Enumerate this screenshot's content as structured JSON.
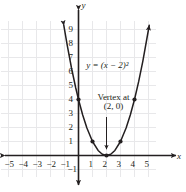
{
  "chart_data": {
    "type": "line",
    "title": "",
    "equation_label": "y = (x − 2)²",
    "annotation": {
      "line1": "Vertex at",
      "line2": "(2, 0)",
      "points_to_x": 2,
      "points_to_y": 0
    },
    "xlabel": "x",
    "ylabel": "y",
    "xlim": [
      -5.6,
      5.6
    ],
    "ylim": [
      -1.6,
      9.6
    ],
    "grid": true,
    "grid_color": "#e8e8ea",
    "axis_color": "#231f20",
    "curve_color": "#231f20",
    "xticks": [
      -5,
      -4,
      -3,
      -2,
      -1,
      1,
      2,
      3,
      4,
      5
    ],
    "xtick_labels": [
      "−5",
      "−4",
      "−3",
      "−2",
      "−1",
      "1",
      "2",
      "3",
      "4",
      "5"
    ],
    "yticks": [
      -1,
      1,
      2,
      3,
      4,
      5,
      6,
      7,
      8,
      9
    ],
    "ytick_labels": [
      "−1",
      "1",
      "2",
      "3",
      "4",
      "5",
      "6",
      "7",
      "8",
      "9"
    ],
    "series": [
      {
        "name": "y = (x - 2)^2",
        "x": [
          -1.05,
          -0.8,
          -0.5,
          -0.2,
          0,
          0.3,
          0.6,
          1,
          1.4,
          1.7,
          2,
          2.3,
          2.6,
          3,
          3.4,
          3.7,
          4,
          4.3,
          4.6,
          5,
          5.05
        ],
        "y": [
          9.3,
          7.84,
          6.25,
          4.84,
          4,
          2.89,
          1.96,
          1,
          0.36,
          0.09,
          0,
          0.09,
          0.36,
          1,
          1.96,
          2.89,
          4,
          5.29,
          6.76,
          9,
          9.3
        ]
      }
    ],
    "markers": [
      {
        "x": 0,
        "y": 4
      },
      {
        "x": 1,
        "y": 1
      },
      {
        "x": 2,
        "y": 0
      },
      {
        "x": 3,
        "y": 1
      },
      {
        "x": 4,
        "y": 4
      }
    ],
    "arrowheads": [
      "curve-left-end",
      "curve-right-end",
      "x-axis-left",
      "x-axis-right",
      "y-axis-top",
      "y-axis-bottom"
    ]
  }
}
